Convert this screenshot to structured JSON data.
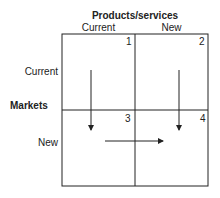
{
  "diagram": {
    "title": "Products/services",
    "columns": [
      "Current",
      "New"
    ],
    "row_axis_label": "Markets",
    "rows": [
      "Current",
      "New"
    ],
    "cells": [
      {
        "number": "1",
        "row": "Current",
        "column": "Current"
      },
      {
        "number": "2",
        "row": "Current",
        "column": "New"
      },
      {
        "number": "3",
        "row": "New",
        "column": "Current"
      },
      {
        "number": "4",
        "row": "New",
        "column": "New"
      }
    ],
    "arrows": [
      {
        "from": "1",
        "to": "3",
        "direction": "down"
      },
      {
        "from": "2",
        "to": "4",
        "direction": "down"
      },
      {
        "from": "3",
        "to": "4",
        "direction": "right"
      }
    ],
    "line_color": "#222222"
  }
}
